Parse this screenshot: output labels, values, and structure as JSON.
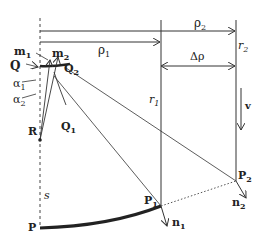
{
  "diagram": {
    "labels": {
      "m1": "m",
      "m1_sub": "1",
      "m2": "m",
      "m2_sub": "2",
      "Q": "Q",
      "Q2": "Q",
      "Q2_sub": "2",
      "Q1": "Q",
      "Q1_sub": "1",
      "alpha1": "α",
      "alpha1_sub": "1",
      "alpha2": "α",
      "alpha2_sub": "2",
      "R": "R",
      "s": "s",
      "P": "P",
      "P1": "P",
      "P1_sub": "1",
      "P2": "P",
      "P2_sub": "2",
      "n1": "n",
      "n1_sub": "1",
      "n2": "n",
      "n2_sub": "2",
      "rho1": "ρ",
      "rho1_sub": "1",
      "rho2": "ρ",
      "rho2_sub": "2",
      "delta_rho": "Δρ",
      "r1": "r",
      "r1_sub": "1",
      "r2": "r",
      "r2_sub": "2",
      "v": "v"
    },
    "colors": {
      "line": "#333333",
      "bold_curve": "#222222"
    }
  }
}
